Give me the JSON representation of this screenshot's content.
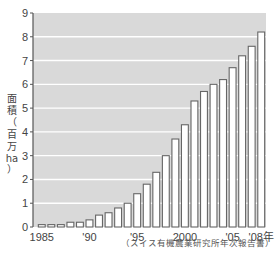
{
  "chart_data": {
    "type": "bar",
    "title": "",
    "xlabel": "",
    "ylabel": "面積（百万ha）",
    "ylabel_lines": [
      "面",
      "積",
      "（",
      "百",
      "万",
      "ha",
      "）"
    ],
    "ylim": [
      0,
      9
    ],
    "yticks": [
      0,
      1,
      2,
      3,
      4,
      5,
      6,
      7,
      8,
      9
    ],
    "grid": true,
    "legend": null,
    "categories": [
      "1985",
      "1986",
      "1987",
      "1988",
      "1989",
      "1990",
      "1991",
      "1992",
      "1993",
      "1994",
      "1995",
      "1996",
      "1997",
      "1998",
      "1999",
      "2000",
      "2001",
      "2002",
      "2003",
      "2004",
      "2005",
      "2006",
      "2007",
      "2008"
    ],
    "values": [
      0.1,
      0.1,
      0.1,
      0.2,
      0.2,
      0.3,
      0.5,
      0.6,
      0.8,
      1.0,
      1.4,
      1.8,
      2.3,
      3.0,
      3.7,
      4.3,
      5.3,
      5.7,
      6.0,
      6.2,
      6.7,
      7.2,
      7.6,
      8.2
    ],
    "xtick_labels": [
      {
        "index": 0,
        "label": "1985"
      },
      {
        "index": 5,
        "label": "'90"
      },
      {
        "index": 10,
        "label": "'95"
      },
      {
        "index": 15,
        "label": "2000"
      },
      {
        "index": 20,
        "label": "'05"
      },
      {
        "index": 23,
        "label": "'08年"
      }
    ],
    "source": "（スイス有機農業研究所年次報告書）",
    "colors": {
      "plot_bg": "#d9d9d9",
      "grid": "#ffffff",
      "bar_fill": "#ffffff",
      "bar_stroke": "#666666",
      "axis": "#555555"
    }
  }
}
